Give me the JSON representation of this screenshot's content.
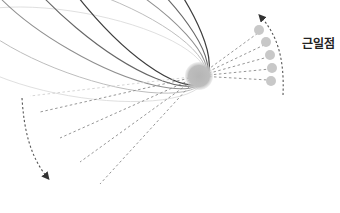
{
  "diagram": {
    "label_perihelion": "근일점",
    "sun": {
      "cx": 199,
      "cy": 76,
      "r": 13,
      "color": "#b8b8b8"
    },
    "orbits": [
      {
        "id": "orbit-1",
        "rx": 132,
        "ry": 42,
        "rotation": 10,
        "stroke": "#d9d9d9",
        "width": 0.8
      },
      {
        "id": "orbit-2",
        "rx": 132,
        "ry": 42,
        "rotation": 20,
        "stroke": "#bdbdbd",
        "width": 0.9
      },
      {
        "id": "orbit-3",
        "rx": 132,
        "ry": 42,
        "rotation": 30,
        "stroke": "#8f8f8f",
        "width": 1.0
      },
      {
        "id": "orbit-4",
        "rx": 132,
        "ry": 42,
        "rotation": 40,
        "stroke": "#666666",
        "width": 1.1
      },
      {
        "id": "orbit-5",
        "rx": 132,
        "ry": 42,
        "rotation": 50,
        "stroke": "#3d3d3d",
        "width": 1.2
      }
    ],
    "perihelion_points": [
      {
        "cx": 259,
        "cy": 30
      },
      {
        "cx": 266,
        "cy": 42
      },
      {
        "cx": 270,
        "cy": 55
      },
      {
        "cx": 272,
        "cy": 68
      },
      {
        "cx": 271,
        "cy": 81
      }
    ],
    "perihelion_point_color": "#c8c8c8",
    "arrows": [
      {
        "id": "arrow-perihelion",
        "direction": "counterclockwise-up"
      },
      {
        "id": "arrow-aphelion",
        "direction": "downward"
      }
    ]
  }
}
